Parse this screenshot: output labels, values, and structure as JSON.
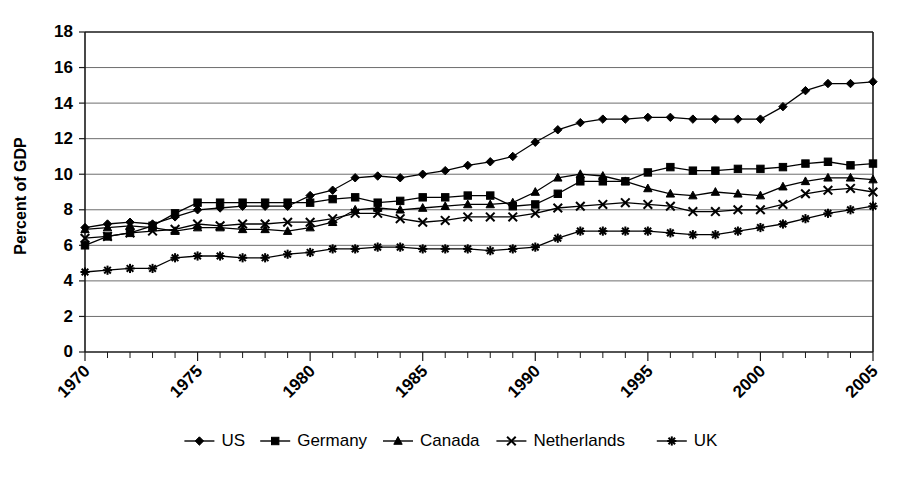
{
  "chart_data": {
    "type": "line",
    "title": "",
    "xlabel": "",
    "ylabel": "Percent of GDP",
    "xlim": [
      1970,
      2005
    ],
    "ylim": [
      0,
      18
    ],
    "yticks": [
      0,
      2,
      4,
      6,
      8,
      10,
      12,
      14,
      16,
      18
    ],
    "xticks": [
      1970,
      1975,
      1980,
      1985,
      1990,
      1995,
      2000,
      2005
    ],
    "xtick_labels": [
      "1970",
      "1975",
      "1980",
      "1985",
      "1990",
      "1995",
      "2000",
      "2005"
    ],
    "ytick_labels": [
      "0",
      "2",
      "4",
      "6",
      "8",
      "10",
      "12",
      "14",
      "16",
      "18"
    ],
    "grid": "horizontal",
    "legend_position": "bottom",
    "x": [
      1970,
      1971,
      1972,
      1973,
      1974,
      1975,
      1976,
      1977,
      1978,
      1979,
      1980,
      1981,
      1982,
      1983,
      1984,
      1985,
      1986,
      1987,
      1988,
      1989,
      1990,
      1991,
      1992,
      1993,
      1994,
      1995,
      1996,
      1997,
      1998,
      1999,
      2000,
      2001,
      2002,
      2003,
      2004,
      2005
    ],
    "series": [
      {
        "name": "US",
        "marker": "diamond",
        "values": [
          7.0,
          7.2,
          7.3,
          7.2,
          7.6,
          8.0,
          8.1,
          8.2,
          8.2,
          8.2,
          8.8,
          9.1,
          9.8,
          9.9,
          9.8,
          10.0,
          10.2,
          10.5,
          10.7,
          11.0,
          11.8,
          12.5,
          12.9,
          13.1,
          13.1,
          13.2,
          13.2,
          13.1,
          13.1,
          13.1,
          13.1,
          13.8,
          14.7,
          15.1,
          15.1,
          15.2
        ]
      },
      {
        "name": "Germany",
        "marker": "square",
        "values": [
          6.0,
          6.5,
          6.7,
          7.1,
          7.8,
          8.4,
          8.4,
          8.4,
          8.4,
          8.4,
          8.4,
          8.6,
          8.7,
          8.4,
          8.5,
          8.7,
          8.7,
          8.8,
          8.8,
          8.2,
          8.3,
          8.9,
          9.6,
          9.6,
          9.6,
          10.1,
          10.4,
          10.2,
          10.2,
          10.3,
          10.3,
          10.4,
          10.6,
          10.7,
          10.5,
          10.6
        ]
      },
      {
        "name": "Canada",
        "marker": "triangle",
        "values": [
          6.9,
          7.0,
          7.1,
          7.0,
          6.8,
          7.0,
          7.0,
          6.9,
          6.9,
          6.8,
          7.0,
          7.3,
          8.0,
          8.1,
          8.0,
          8.1,
          8.2,
          8.3,
          8.3,
          8.4,
          9.0,
          9.8,
          10.0,
          9.9,
          9.6,
          9.2,
          8.9,
          8.8,
          9.0,
          8.9,
          8.8,
          9.3,
          9.6,
          9.8,
          9.8,
          9.7
        ]
      },
      {
        "name": "Netherlands",
        "marker": "x",
        "values": [
          6.4,
          6.5,
          6.7,
          6.8,
          6.9,
          7.2,
          7.1,
          7.2,
          7.2,
          7.3,
          7.3,
          7.5,
          7.8,
          7.8,
          7.5,
          7.3,
          7.4,
          7.6,
          7.6,
          7.6,
          7.8,
          8.1,
          8.2,
          8.3,
          8.4,
          8.3,
          8.2,
          7.9,
          7.9,
          8.0,
          8.0,
          8.3,
          8.9,
          9.1,
          9.2,
          9.0
        ]
      },
      {
        "name": "UK",
        "marker": "asterisk",
        "values": [
          4.5,
          4.6,
          4.7,
          4.7,
          5.3,
          5.4,
          5.4,
          5.3,
          5.3,
          5.5,
          5.6,
          5.8,
          5.8,
          5.9,
          5.9,
          5.8,
          5.8,
          5.8,
          5.7,
          5.8,
          5.9,
          6.4,
          6.8,
          6.8,
          6.8,
          6.8,
          6.7,
          6.6,
          6.6,
          6.8,
          7.0,
          7.2,
          7.5,
          7.8,
          8.0,
          8.2
        ]
      }
    ]
  },
  "legend": {
    "items": [
      {
        "label": "US"
      },
      {
        "label": "Germany"
      },
      {
        "label": "Canada"
      },
      {
        "label": "Netherlands"
      },
      {
        "label": "UK"
      }
    ]
  }
}
